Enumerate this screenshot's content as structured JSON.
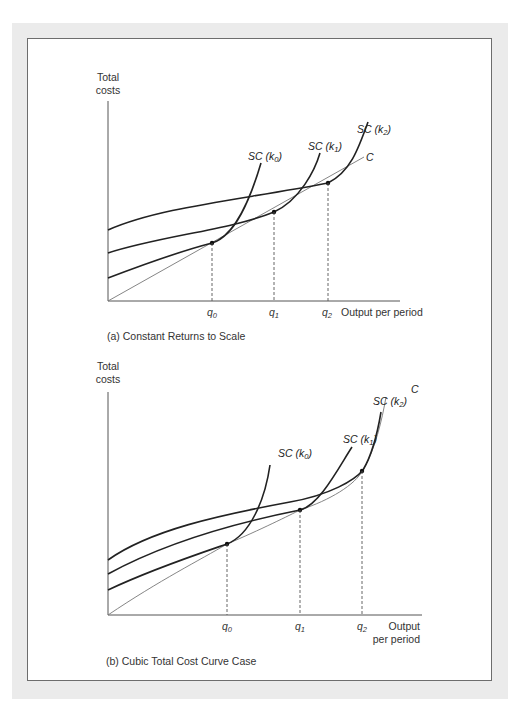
{
  "panels": [
    {
      "id": "a",
      "caption": "(a) Constant Returns to Scale",
      "y_axis_label_line1": "Total",
      "y_axis_label_line2": "costs",
      "x_axis_label": "Output per period",
      "x_ticks": [
        "q0",
        "q1",
        "q2"
      ],
      "curves": [
        {
          "name": "SC (k0)",
          "label_main": "SC (k",
          "label_sub": "0",
          "label_end": ")"
        },
        {
          "name": "SC (k1)",
          "label_main": "SC (k",
          "label_sub": "1",
          "label_end": ")"
        },
        {
          "name": "SC (k2)",
          "label_main": "SC (k",
          "label_sub": "2",
          "label_end": ")"
        },
        {
          "name": "C",
          "label_main": "C"
        }
      ]
    },
    {
      "id": "b",
      "caption": "(b) Cubic Total Cost Curve Case",
      "y_axis_label_line1": "Total",
      "y_axis_label_line2": "costs",
      "x_axis_label_line1": "Output",
      "x_axis_label_line2": "per period",
      "x_ticks": [
        "q0",
        "q1",
        "q2"
      ],
      "curves": [
        {
          "name": "SC (k0)",
          "label_main": "SC (k",
          "label_sub": "0",
          "label_end": ")"
        },
        {
          "name": "SC (k1)",
          "label_main": "SC (k",
          "label_sub": "1",
          "label_end": ")"
        },
        {
          "name": "SC (k2)",
          "label_main": "SC (k",
          "label_sub": "2",
          "label_end": ")"
        },
        {
          "name": "C",
          "label_main": "C"
        }
      ]
    }
  ],
  "tick_symbol": "q",
  "tick_subs": [
    "0",
    "1",
    "2"
  ]
}
